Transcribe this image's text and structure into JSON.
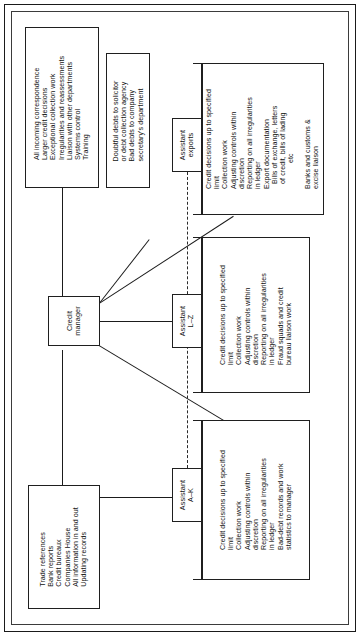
{
  "diagram": {
    "orientation": "rotated-90-ccw",
    "nodes": {
      "credit_manager": {
        "label_lines": [
          "Credit",
          "manager"
        ]
      },
      "assistant_exports": {
        "label_lines": [
          "Assistant",
          "exports"
        ]
      },
      "assistant_lz": {
        "label_lines": [
          "Assistant",
          "L–Z"
        ]
      },
      "assistant_ak": {
        "label_lines": [
          "Assistant",
          "A–K"
        ]
      }
    },
    "duty_boxes": {
      "manager_duties": {
        "lines": [
          "All incoming correspondence",
          "Larger credit decisions",
          "Exceptional collection work",
          "Irregularities and reassessments",
          "Liaison with other departments",
          "Systems control",
          "Training"
        ]
      },
      "debt_escalation": {
        "lines": [
          "Doubtful debts to solicitor",
          "or debt collection agency",
          "Bad debts to company",
          "secretary's department"
        ]
      },
      "information_sources": {
        "lines": [
          "Trade references",
          "Bank reports",
          "Credit bureaux",
          "Companies House",
          "All information in and out",
          "Updating records"
        ]
      },
      "exports_duties": {
        "lines": [
          "Credit decisions up to specified",
          "limit",
          "Collection work",
          "Adjusting controls within",
          "discretion",
          "Reporting on all irregularities",
          "in ledger",
          "Export documentation",
          "Bills of exchange, letters",
          "of credit, bills of lading",
          "etc",
          "Banks and customs &",
          "excise liaison"
        ],
        "indented": [
          8,
          9,
          10
        ]
      },
      "lz_duties": {
        "lines": [
          "Credit decisions up to specified",
          "limit",
          "Collection work",
          "Adjusting controls within",
          "discretion",
          "Reporting on all irregularities",
          "in ledger",
          "Fraud squads and credit",
          "bureau liaison work"
        ],
        "indented": []
      },
      "ak_duties": {
        "lines": [
          "Credit decisions up to specified",
          "limit",
          "Collection work",
          "Adjusting controls within",
          "discretion",
          "Reporting on all irregularities",
          "in ledger",
          "Bad-debt records and work",
          "statistics to manager"
        ],
        "indented": []
      }
    },
    "colors": {
      "ink": "#1b1b1b",
      "paper": "#ffffff",
      "frame": "#1a1a1a"
    }
  }
}
